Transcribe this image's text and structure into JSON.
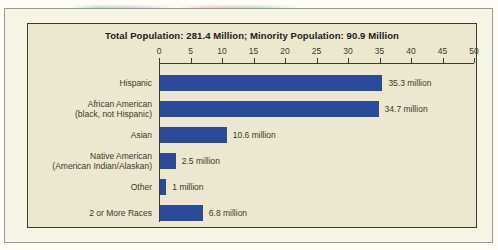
{
  "chart_title": "Total Population: 281.4 Million; Minority Population: 90.9 Million",
  "colors": {
    "bar": "#2b4a9b",
    "plot_background": "#ece8cf",
    "frame_background": "#f4f5e4",
    "page_background": "#fdfdf5",
    "axis": "#3d3a28",
    "text": "#3a3828",
    "title_text": "#20201a"
  },
  "axis": {
    "ticks": [
      "0",
      "5",
      "10",
      "15",
      "20",
      "25",
      "30",
      "35",
      "40",
      "45",
      "50"
    ],
    "min": 0,
    "max": 50,
    "step": 5
  },
  "chart_data": {
    "type": "bar",
    "orientation": "horizontal",
    "title": "Total Population: 281.4 Million; Minority Population: 90.9 Million",
    "xlabel": "",
    "ylabel": "",
    "xlim": [
      0,
      50
    ],
    "grid": false,
    "legend": "none",
    "unit": "million",
    "categories": [
      "Hispanic",
      "African American (black, not Hispanic)",
      "Asian",
      "Native American (American Indian/Alaskan)",
      "Other",
      "2 or More Races"
    ],
    "values": [
      35.3,
      34.7,
      10.6,
      2.5,
      1,
      6.8
    ],
    "data_labels": [
      "35.3 million",
      "34.7 million",
      "10.6 million",
      "2.5 million",
      "1 million",
      "6.8 million"
    ],
    "tick_labels": [
      "0",
      "5",
      "10",
      "15",
      "20",
      "25",
      "30",
      "35",
      "40",
      "45",
      "50"
    ]
  },
  "rows": [
    {
      "label_line1": "Hispanic",
      "label_line2": "",
      "value": 35.3,
      "value_label": "35.3 million"
    },
    {
      "label_line1": "African American",
      "label_line2": "(black, not Hispanic)",
      "value": 34.7,
      "value_label": "34.7 million"
    },
    {
      "label_line1": "Asian",
      "label_line2": "",
      "value": 10.6,
      "value_label": "10.6 million"
    },
    {
      "label_line1": "Native American",
      "label_line2": "(American Indian/Alaskan)",
      "value": 2.5,
      "value_label": "2.5 million"
    },
    {
      "label_line1": "Other",
      "label_line2": "",
      "value": 1,
      "value_label": "1 million"
    },
    {
      "label_line1": "2 or More Races",
      "label_line2": "",
      "value": 6.8,
      "value_label": "6.8 million"
    }
  ]
}
